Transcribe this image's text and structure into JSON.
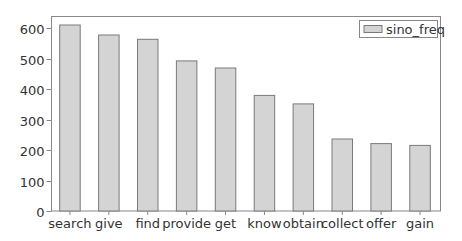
{
  "chart_data": {
    "type": "bar",
    "title": "",
    "xlabel": "",
    "ylabel": "",
    "categories": [
      "search",
      "give",
      "find",
      "provide",
      "get",
      "know",
      "obtain",
      "collect",
      "offer",
      "gain"
    ],
    "series": [
      {
        "name": "sino_freq",
        "values": [
          610,
          577,
          563,
          492,
          469,
          379,
          351,
          236,
          221,
          215
        ]
      }
    ],
    "ylim": [
      0,
      640
    ],
    "yticks": [
      0,
      100,
      200,
      300,
      400,
      500,
      600
    ],
    "grid": false,
    "legend_position": "upper right",
    "colors": {
      "bar_fill": "#d4d4d4",
      "bar_edge": "#7a7a7a",
      "axis": "#888888",
      "text": "#333333"
    }
  }
}
